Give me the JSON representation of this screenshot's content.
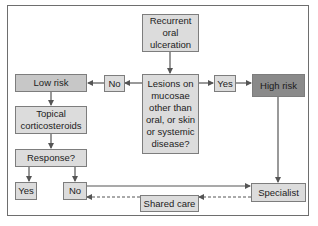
{
  "diagram": {
    "type": "flowchart",
    "nodes": {
      "start": "Recurrent\noral\nulceration",
      "question": "Lesions on\nmucosae\nother than\noral, or skin\nor systemic\ndisease?",
      "no_label": "No",
      "yes_label": "Yes",
      "low_risk": "Low risk",
      "high_risk": "High risk",
      "treatment": "Topical\ncorticosteroids",
      "response": "Response?",
      "response_yes": "Yes",
      "response_no": "No",
      "specialist": "Specialist",
      "shared_care": "Shared care"
    },
    "edges": [
      {
        "from": "start",
        "to": "question",
        "style": "solid"
      },
      {
        "from": "question",
        "to": "no_label",
        "style": "solid"
      },
      {
        "from": "no_label",
        "to": "low_risk",
        "style": "solid"
      },
      {
        "from": "question",
        "to": "yes_label",
        "style": "solid"
      },
      {
        "from": "yes_label",
        "to": "high_risk",
        "style": "solid"
      },
      {
        "from": "low_risk",
        "to": "treatment",
        "style": "solid"
      },
      {
        "from": "treatment",
        "to": "response",
        "style": "solid"
      },
      {
        "from": "response",
        "to": "response_yes",
        "style": "solid"
      },
      {
        "from": "response",
        "to": "response_no",
        "style": "solid"
      },
      {
        "from": "high_risk",
        "to": "specialist",
        "style": "solid"
      },
      {
        "from": "response_no",
        "to": "specialist",
        "style": "solid"
      },
      {
        "from": "specialist",
        "to": "shared_care",
        "style": "dashed"
      },
      {
        "from": "shared_care",
        "to": "response_no",
        "style": "dashed"
      }
    ],
    "colors": {
      "box_light": "#dcdcdc",
      "box_medium": "#c7c7c7",
      "box_dark": "#8a8a8a",
      "line": "#555555",
      "frame": "#6e6e6e"
    }
  }
}
